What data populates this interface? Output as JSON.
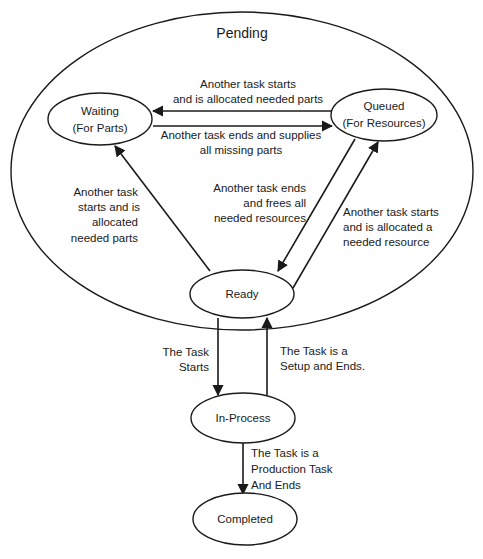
{
  "diagram": {
    "container": {
      "label": "Pending"
    },
    "states": {
      "waiting": {
        "line1": "Waiting",
        "line2": "(For Parts)"
      },
      "queued": {
        "line1": "Queued",
        "line2": "(For Resources)"
      },
      "ready": {
        "label": "Ready"
      },
      "in_process": {
        "label": "In-Process"
      },
      "completed": {
        "label": "Completed"
      }
    },
    "transitions": {
      "queued_to_waiting": {
        "lines": [
          "Another task starts",
          "and is allocated needed parts"
        ]
      },
      "waiting_to_queued": {
        "lines": [
          "Another task ends and supplies",
          "all missing parts"
        ]
      },
      "ready_to_waiting": {
        "lines": [
          "Another task",
          "starts and is",
          "allocated",
          "needed parts"
        ]
      },
      "queued_to_ready": {
        "lines": [
          "Another task ends",
          "and frees all",
          "needed resources"
        ]
      },
      "ready_to_queued": {
        "lines": [
          "Another task starts",
          "and is allocated a",
          "needed resource"
        ]
      },
      "ready_to_in_process": {
        "lines": [
          "The Task",
          "Starts"
        ]
      },
      "in_process_to_ready": {
        "lines": [
          "The Task is a",
          "Setup and Ends."
        ]
      },
      "in_process_to_completed": {
        "lines": [
          "The Task is a",
          "Production Task",
          "And Ends"
        ]
      }
    },
    "colors": {
      "stroke": "#1a1a1a",
      "background": "#ffffff"
    }
  }
}
